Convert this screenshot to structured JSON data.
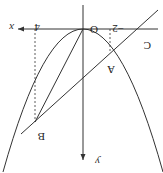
{
  "diagram": {
    "orientation": "rotated 180 degrees",
    "labels": {
      "origin": "O",
      "x_axis": "x",
      "y_axis": "y",
      "point_a": "A",
      "point_b": "B",
      "point_c": "C",
      "tick_neg2": "−2",
      "tick_4": "4"
    },
    "colors": {
      "stroke": "#333333",
      "background": "#ffffff"
    }
  }
}
